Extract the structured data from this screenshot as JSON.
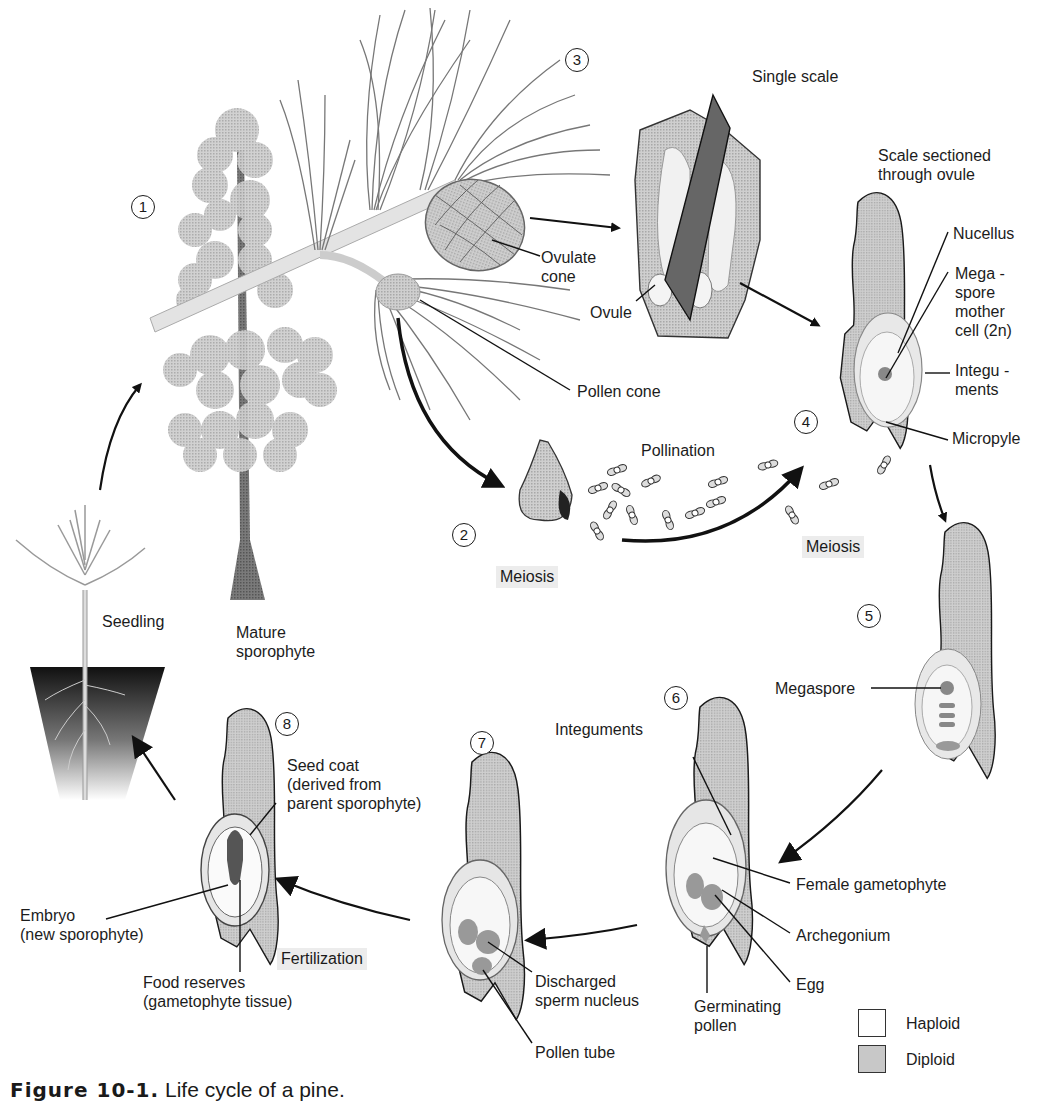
{
  "figure": {
    "caption_number": "Figure 10-1.",
    "caption_text": "Life cycle of a pine.",
    "colors": {
      "diploid": "#c8c8c8",
      "haploid": "#ffffff",
      "line": "#1a1a1a",
      "process_bg": "#ececec"
    }
  },
  "steps": [
    {
      "n": "1"
    },
    {
      "n": "2"
    },
    {
      "n": "3"
    },
    {
      "n": "4"
    },
    {
      "n": "5"
    },
    {
      "n": "6"
    },
    {
      "n": "7"
    },
    {
      "n": "8"
    }
  ],
  "labels": {
    "mature_sporophyte": "Mature\nsporophyte",
    "seedling": "Seedling",
    "ovulate_cone": "Ovulate\ncone",
    "pollen_cone": "Pollen cone",
    "single_scale": "Single scale",
    "ovule": "Ovule",
    "scale_sectioned": "Scale sectioned\nthrough ovule",
    "nucellus": "Nucellus",
    "megaspore_mother_cell": "Mega -\nspore\nmother\ncell (2n)",
    "integuments_4": "Integu -\nments",
    "micropyle": "Micropyle",
    "pollination": "Pollination",
    "megaspore": "Megaspore",
    "integuments_6": "Integuments",
    "female_gametophyte": "Female gametophyte",
    "archegonium": "Archegonium",
    "egg": "Egg",
    "germinating_pollen": "Germinating\npollen",
    "discharged_sperm_nucleus": "Discharged\nsperm nucleus",
    "pollen_tube": "Pollen tube",
    "seed_coat": "Seed coat\n(derived from\nparent sporophyte)",
    "embryo": "Embryo\n(new sporophyte)",
    "food_reserves": "Food reserves\n(gametophyte tissue)"
  },
  "processes": {
    "meiosis_pollen": "Meiosis",
    "meiosis_ovule": "Meiosis",
    "fertilization": "Fertilization"
  },
  "legend": [
    {
      "label": "Haploid",
      "type": "haploid"
    },
    {
      "label": "Diploid",
      "type": "diploid"
    }
  ]
}
